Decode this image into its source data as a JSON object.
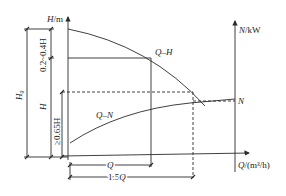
{
  "diagram": {
    "type": "pump-characteristic-curves",
    "axes": {
      "head_axis_label": "H/m",
      "power_axis_label": "N/kW",
      "flow_axis_label": "Q/(m³/h)"
    },
    "curves": {
      "head_curve_label": "Q–H",
      "power_curve_label": "Q–N",
      "power_point_label": "N"
    },
    "dimensions": {
      "total_head": "H₀",
      "head": "H",
      "upper_margin": "0.2~0.4H",
      "lower_margin": "≥0.65H",
      "flow": "Q",
      "flow_extended": "1.5Q"
    },
    "colors": {
      "line": "#2a2a2a",
      "background": "#ffffff"
    }
  }
}
